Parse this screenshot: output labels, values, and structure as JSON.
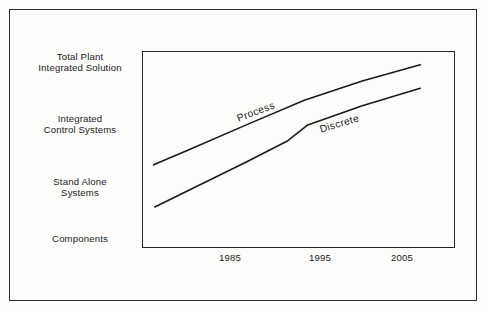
{
  "chart_data": {
    "type": "line",
    "title": "",
    "xlabel": "",
    "ylabel": "",
    "grid": false,
    "legend_position": "inline-along-lines",
    "x_ticks": [
      "1985",
      "1995",
      "2005"
    ],
    "x_tick_values": [
      1985,
      1995,
      2005
    ],
    "xlim": [
      1981,
      2008
    ],
    "y_ticks": [
      "Components",
      "Stand Alone\nSystems",
      "Integrated\nControl Systems",
      "Total Plant\nIntegrated Solution"
    ],
    "y_tick_levels": [
      0,
      1,
      2,
      3
    ],
    "ylim": [
      -0.25,
      3.35
    ],
    "series": [
      {
        "name": "Process",
        "label": "Process",
        "points": [
          {
            "x": 1982.0,
            "y": 1.27
          },
          {
            "x": 1985.0,
            "y": 1.54
          },
          {
            "x": 1990.0,
            "y": 2.0
          },
          {
            "x": 1995.0,
            "y": 2.45
          },
          {
            "x": 2000.0,
            "y": 2.8
          },
          {
            "x": 2005.0,
            "y": 3.1
          }
        ]
      },
      {
        "name": "Discrete",
        "label": "Discrete",
        "points": [
          {
            "x": 1982.1,
            "y": 0.5
          },
          {
            "x": 1985.0,
            "y": 0.8
          },
          {
            "x": 1990.0,
            "y": 1.32
          },
          {
            "x": 1993.5,
            "y": 1.7
          },
          {
            "x": 1995.3,
            "y": 2.0
          },
          {
            "x": 2000.0,
            "y": 2.35
          },
          {
            "x": 2005.0,
            "y": 2.67
          }
        ]
      }
    ]
  },
  "axes": {
    "y_labels": [
      {
        "text": "Total Plant\nIntegrated Solution",
        "top": 51
      },
      {
        "text": "Integrated\nControl Systems",
        "top": 113
      },
      {
        "text": "Stand Alone\nSystems",
        "top": 176
      },
      {
        "text": "Components",
        "top": 233
      }
    ],
    "x_labels": [
      {
        "text": "1985",
        "left": 200
      },
      {
        "text": "1995",
        "left": 290
      },
      {
        "text": "2005",
        "left": 372
      }
    ]
  },
  "series_labels": {
    "process": "Process",
    "discrete": "Discrete"
  },
  "colors": {
    "line": "#1a1a1a",
    "frame": "#242424",
    "outer_frame": "#2b2b2b",
    "background": "#fdfdfc",
    "text": "#1a1a1a"
  }
}
